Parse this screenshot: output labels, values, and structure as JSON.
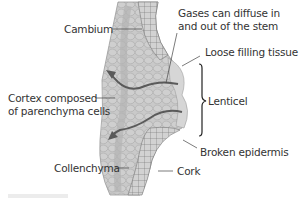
{
  "diagram": {
    "colors": {
      "stem_fill": "#c8c8c8",
      "cell_line": "#a8a8a8",
      "cork_line": "#777777",
      "arrow": "#5a5a5a",
      "leader_line": "#444444",
      "text": "#333333"
    },
    "labels": {
      "cambium": "Cambium",
      "gases_line1": "Gases can diffuse in",
      "gases_line2": "and out of the stem",
      "loose_filling": "Loose filling tissue",
      "cortex_line1": "Cortex composed",
      "cortex_line2": "of parenchyma cells",
      "lenticel": "Lenticel",
      "broken_epidermis": "Broken epidermis",
      "collenchyma": "Collenchyma",
      "cork": "Cork"
    },
    "arrows": [
      {
        "name": "upper-gas-arrow",
        "direction": "outward-left"
      },
      {
        "name": "lower-gas-arrow",
        "direction": "outward-left"
      }
    ]
  }
}
